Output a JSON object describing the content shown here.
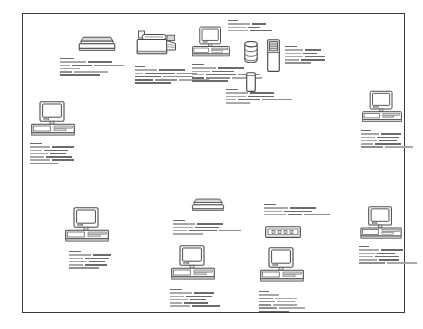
{
  "diagram": {
    "frame": {
      "border_color": "#3a3a3a",
      "background": "#ffffff",
      "x": 22,
      "y": 13,
      "width": 383,
      "height": 300
    },
    "text_color_primary": "#8e8e8e",
    "text_color_dark": "#6b6b6b",
    "text_color_light": "#a8a8a8",
    "icon_stroke": "#4a4a4a",
    "icon_fill": "#ffffff",
    "icon_shade": "#d8d8d8",
    "nodes": [
      {
        "id": "scanner-top",
        "icon": "flatbed-scanner-icon",
        "label": "",
        "x": 78,
        "y": 36,
        "w": 38,
        "h": 16,
        "caption": {
          "x": -18,
          "y": 22,
          "w": 80,
          "lines": [
            14,
            4,
            26,
            24,
            4,
            10,
            20,
            30,
            20,
            4,
            12,
            34,
            40
          ]
        }
      },
      {
        "id": "printer-top",
        "icon": "printer-icon",
        "label": "",
        "x": 136,
        "y": 30,
        "w": 42,
        "h": 30,
        "caption": {
          "x": -1,
          "y": 36,
          "w": 84,
          "lines": [
            10,
            4,
            22,
            26,
            4,
            8,
            30,
            20,
            4,
            26,
            30,
            4,
            18,
            22,
            30,
            36
          ]
        }
      },
      {
        "id": "workstation-top-center",
        "icon": "desktop-computer-icon",
        "label": "",
        "x": 192,
        "y": 26,
        "w": 38,
        "h": 32,
        "caption": {
          "x": 0,
          "y": 38,
          "w": 78,
          "lines": [
            12,
            4,
            24,
            26,
            4,
            18,
            22,
            4,
            12,
            30,
            22,
            4,
            12,
            24,
            30,
            36
          ]
        }
      },
      {
        "id": "database-server",
        "icon": "database-cylinder-icon",
        "label": "",
        "x": 244,
        "y": 41,
        "w": 14,
        "h": 22,
        "caption": {
          "x": -18,
          "y": 48,
          "w": 68,
          "lines": [
            12,
            4,
            22,
            24,
            4,
            20,
            26,
            4,
            10,
            22,
            30,
            24
          ]
        }
      },
      {
        "id": "network-node-top",
        "icon": "tower-unit-icon",
        "label": "",
        "x": 246,
        "y": 72,
        "w": 10,
        "h": 20,
        "caption": {
          "x": 0,
          "y": 0,
          "w": 0,
          "lines": []
        }
      },
      {
        "id": "server-tower",
        "icon": "server-tower-icon",
        "label": "",
        "x": 267,
        "y": 39,
        "w": 13,
        "h": 33,
        "caption": {
          "x": 18,
          "y": 7,
          "w": 62,
          "lines": [
            12,
            4,
            18,
            16,
            4,
            16,
            14,
            4,
            18,
            20,
            4,
            14,
            24,
            26
          ]
        }
      },
      {
        "id": "caption-top-right-standalone",
        "icon": "",
        "label": "",
        "x": 228,
        "y": 20,
        "w": 0,
        "h": 0,
        "caption": {
          "x": 0,
          "y": 0,
          "w": 52,
          "lines": [
            10,
            4,
            22,
            14,
            4,
            18,
            12,
            4,
            20,
            22
          ]
        }
      },
      {
        "id": "workstation-left",
        "icon": "desktop-computer-icon",
        "label": "",
        "x": 31,
        "y": 101,
        "w": 44,
        "h": 36,
        "caption": {
          "x": -1,
          "y": 42,
          "w": 66,
          "lines": [
            12,
            4,
            20,
            22,
            4,
            12,
            24,
            4,
            18,
            16,
            4,
            14,
            26,
            4,
            20,
            22,
            28
          ]
        }
      },
      {
        "id": "workstation-right-top",
        "icon": "desktop-computer-icon",
        "label": "",
        "x": 362,
        "y": 90,
        "w": 40,
        "h": 34,
        "caption": {
          "x": -1,
          "y": 40,
          "w": 60,
          "lines": [
            10,
            4,
            18,
            20,
            4,
            14,
            22,
            4,
            16,
            18,
            4,
            12,
            26,
            22,
            28
          ]
        }
      },
      {
        "id": "workstation-bottom-left",
        "icon": "desktop-computer-icon",
        "label": "",
        "x": 65,
        "y": 207,
        "w": 44,
        "h": 36,
        "caption": {
          "x": 4,
          "y": 44,
          "w": 62,
          "lines": [
            12,
            4,
            22,
            18,
            4,
            14,
            24,
            4,
            18,
            16,
            4,
            14,
            22,
            30
          ]
        }
      },
      {
        "id": "scanner-bottom",
        "icon": "flatbed-scanner-icon",
        "label": "",
        "x": 189,
        "y": 198,
        "w": 38,
        "h": 14,
        "caption": {
          "x": -16,
          "y": 22,
          "w": 72,
          "lines": [
            12,
            4,
            22,
            26,
            4,
            20,
            24,
            4,
            14,
            28,
            22,
            30
          ]
        }
      },
      {
        "id": "network-hub",
        "icon": "network-hub-icon",
        "label": "",
        "x": 265,
        "y": 226,
        "w": 36,
        "h": 12,
        "caption": {
          "x": -1,
          "y": -22,
          "w": 72,
          "lines": [
            12,
            4,
            24,
            26,
            4,
            18,
            28,
            4,
            22,
            14,
            26
          ]
        }
      },
      {
        "id": "workstation-right-bottom",
        "icon": "desktop-computer-icon",
        "label": "",
        "x": 360,
        "y": 206,
        "w": 42,
        "h": 34,
        "caption": {
          "x": -1,
          "y": 40,
          "w": 62,
          "lines": [
            10,
            4,
            20,
            22,
            4,
            16,
            18,
            4,
            14,
            24,
            4,
            18,
            20,
            26,
            30
          ]
        }
      },
      {
        "id": "workstation-bottom-center",
        "icon": "desktop-computer-icon",
        "label": "",
        "x": 171,
        "y": 245,
        "w": 44,
        "h": 36,
        "caption": {
          "x": -1,
          "y": 44,
          "w": 64,
          "lines": [
            12,
            4,
            22,
            20,
            4,
            14,
            26,
            4,
            18,
            16,
            4,
            12,
            24,
            4,
            20,
            28
          ]
        }
      },
      {
        "id": "workstation-bottom-right-center",
        "icon": "desktop-computer-icon",
        "label": "",
        "x": 260,
        "y": 247,
        "w": 44,
        "h": 36,
        "caption": {
          "x": -1,
          "y": 44,
          "w": 64,
          "lines": [
            10,
            4,
            20,
            4,
            14,
            22,
            4,
            16,
            18,
            4,
            12,
            24,
            4,
            18,
            26,
            30
          ]
        }
      }
    ]
  }
}
